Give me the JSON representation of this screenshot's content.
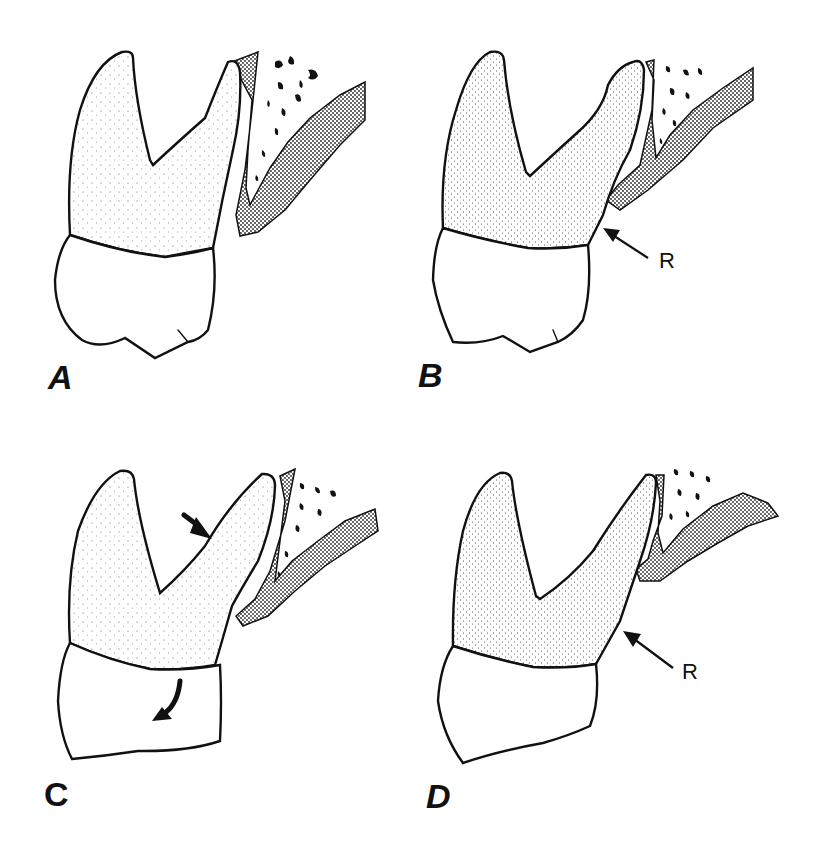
{
  "figure": {
    "panels": [
      {
        "id": "A",
        "label": "A",
        "annotations": []
      },
      {
        "id": "B",
        "label": "B",
        "annotations": [
          {
            "type": "arrow",
            "label": "R"
          }
        ]
      },
      {
        "id": "C",
        "label": "C",
        "annotations": [
          {
            "type": "arrow",
            "label": ""
          },
          {
            "type": "curved-arrow",
            "label": ""
          }
        ]
      },
      {
        "id": "D",
        "label": "D",
        "annotations": [
          {
            "type": "arrow",
            "label": "R"
          }
        ]
      }
    ]
  },
  "colors": {
    "line": "#111111",
    "background": "#ffffff",
    "stipple": "#222222"
  }
}
